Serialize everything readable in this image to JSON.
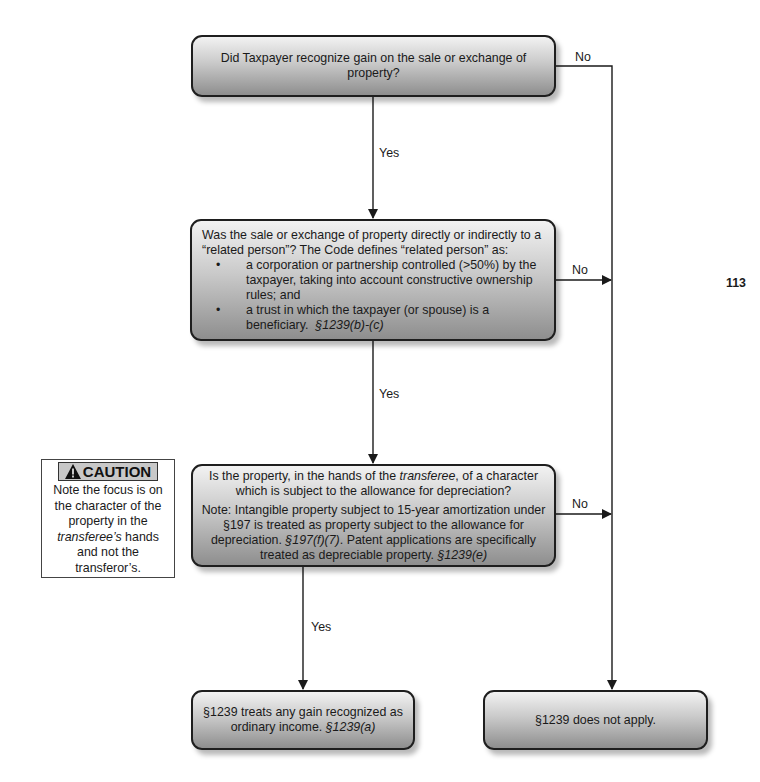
{
  "nodes": {
    "q1": {
      "text": "Did Taxpayer recognize gain on the sale or exchange of property?"
    },
    "q2": {
      "intro": "Was the sale or exchange of property directly or indirectly to a “related person”?  The Code defines “related person” as:",
      "bullets": [
        "a corporation or partnership controlled (>50%) by the taxpayer, taking into account constructive ownership rules; and",
        "a trust in which the taxpayer (or spouse) is a beneficiary."
      ],
      "citation": "§1239(b)-(c)"
    },
    "q3": {
      "question_pre": "Is the property, in the hands of the ",
      "question_em": "transferee",
      "question_post": ", of a character which is subject to the allowance for depreciation?",
      "note_pre": "Note:  Intangible property subject to 15-year amortization under §197 is treated as property subject to the allowance for depreciation. ",
      "note_cite1": "§197(f)(7)",
      "note_mid": ".  Patent applications are specifically treated as depreciable property.  ",
      "note_cite2": "§1239(e)"
    },
    "result_yes": {
      "text": "§1239 treats any gain recognized as ordinary income.  ",
      "citation": "§1239(a)"
    },
    "result_no": {
      "text": "§1239 does not apply."
    }
  },
  "edge_labels": {
    "q1_no": "No",
    "q1_yes": "Yes",
    "q2_no": "No",
    "q2_yes": "Yes",
    "q3_no": "No",
    "q3_yes": "Yes"
  },
  "caution": {
    "icon": "warning-triangle-icon",
    "title": "CAUTION",
    "line1": "Note the focus is on the character of the property in the",
    "emphasis": "transferee’s",
    "line2": " hands and not the transferor’s."
  },
  "page_number": "113",
  "colors": {
    "node_gradient_top": "#f2f2f2",
    "node_gradient_bottom": "#8e8e8e",
    "border": "#1e1e1e",
    "caution_header_bg": "#c8c8c8"
  }
}
